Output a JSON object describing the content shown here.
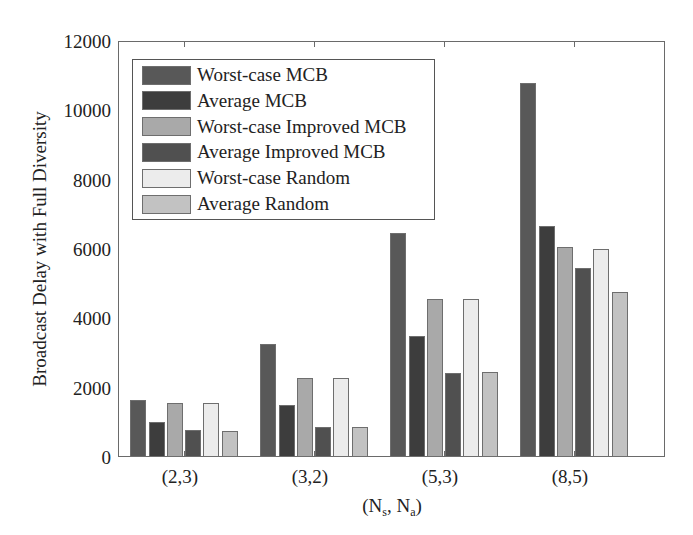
{
  "chart_data": {
    "type": "bar",
    "title": "",
    "xlabel": "(N_s, N_a)",
    "xlabel_main_1": "(N",
    "xlabel_sub_1": "s",
    "xlabel_main_2": ", N",
    "xlabel_sub_2": "a",
    "xlabel_main_3": ")",
    "ylabel": "Broadcast Delay with Full Diversity",
    "ylim": [
      0,
      12000
    ],
    "yticks": [
      0,
      2000,
      4000,
      6000,
      8000,
      10000,
      12000
    ],
    "grid": false,
    "legend_position": "upper left",
    "categories": [
      "(2,3)",
      "(3,2)",
      "(5,3)",
      "(8,5)"
    ],
    "series": [
      {
        "name": "Worst-case MCB",
        "color": "#585858",
        "values": [
          1650,
          3250,
          6450,
          10800
        ]
      },
      {
        "name": "Average MCB",
        "color": "#3d3d3d",
        "values": [
          1000,
          1500,
          3500,
          6650
        ]
      },
      {
        "name": "Worst-case Improved MCB",
        "color": "#a9a9a9",
        "values": [
          1550,
          2270,
          4550,
          6050
        ]
      },
      {
        "name": "Average Improved MCB",
        "color": "#505050",
        "values": [
          770,
          870,
          2430,
          5450
        ]
      },
      {
        "name": "Worst-case Random",
        "color": "#ececec",
        "values": [
          1550,
          2270,
          4550,
          6000
        ]
      },
      {
        "name": "Average Random",
        "color": "#c2c2c2",
        "values": [
          740,
          870,
          2450,
          4750
        ]
      }
    ]
  }
}
